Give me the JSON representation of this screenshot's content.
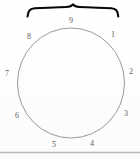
{
  "figure": {
    "type": "circle-position-diagram",
    "background_color": "#ffffff",
    "circle": {
      "stroke_color": "#8c8c92",
      "stroke_width": 0.9,
      "center_x": 71,
      "center_y": 83,
      "radius_x": 53,
      "radius_y": 55
    },
    "brace": {
      "stroke_color": "#141414",
      "label": "9",
      "start_x": 27,
      "end_x": 118,
      "y": 10,
      "tip_x": 73
    },
    "baseline_rule": {
      "color": "#b9b9bd",
      "y": 152
    },
    "labels": [
      {
        "text": "1",
        "x": 111,
        "y": 31,
        "clock_position": "upper-right"
      },
      {
        "text": "2",
        "x": 129,
        "y": 68,
        "clock_position": "right"
      },
      {
        "text": "3",
        "x": 124,
        "y": 110,
        "clock_position": "lower-right"
      },
      {
        "text": "4",
        "x": 90,
        "y": 140,
        "clock_position": "bottom-right"
      },
      {
        "text": "5",
        "x": 52,
        "y": 141,
        "clock_position": "bottom-left"
      },
      {
        "text": "6",
        "x": 15,
        "y": 112,
        "clock_position": "lower-left"
      },
      {
        "text": "7",
        "x": 5,
        "y": 70,
        "clock_position": "left"
      },
      {
        "text": "8",
        "x": 27,
        "y": 33,
        "clock_position": "upper-left"
      }
    ]
  }
}
